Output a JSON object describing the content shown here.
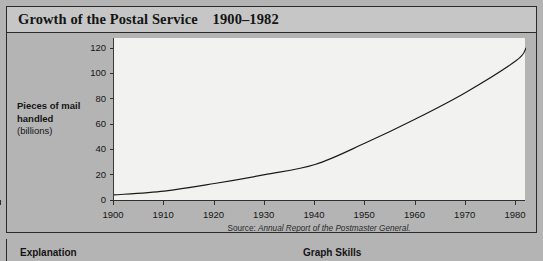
{
  "figure": {
    "title_main": "Growth of the Postal Service",
    "title_range": "1900–1982",
    "title_full": "Growth of the Postal Service    1900–1982",
    "source_label": "Source:",
    "source_title": "Annual Report of the Postmaster General."
  },
  "axis": {
    "y_label_main": "Pieces of mail handled",
    "y_label_line1": "Pieces of mail",
    "y_label_line2": "handled",
    "y_label_units": "(billions)"
  },
  "bottom": {
    "explanation_heading": "Explanation",
    "graph_skills_heading": "Graph Skills"
  },
  "colors": {
    "page_background": "#b4b4b4",
    "title_band": "#c6c6c6",
    "plot_background": "#f2f2f0",
    "frame_border": "#2a2a2a",
    "axis": "#2f2f2f",
    "curve": "#1a1a1a",
    "text": "#141414"
  },
  "chart_data": {
    "type": "line",
    "title": "Growth of the Postal Service    1900–1982",
    "subtitle": "",
    "xlabel": "",
    "ylabel": "Pieces of mail handled (billions)",
    "xlim": [
      1900,
      1982
    ],
    "ylim": [
      0,
      128
    ],
    "grid": false,
    "legend": "none",
    "ytick_labels": [
      "0",
      "20",
      "40",
      "60",
      "80",
      "100",
      "120"
    ],
    "ytick_values": [
      0,
      20,
      40,
      60,
      80,
      100,
      120
    ],
    "xtick_labels": [
      "1900",
      "1910",
      "1920",
      "1930",
      "1940",
      "1950",
      "1960",
      "1970",
      "1980"
    ],
    "xtick_values": [
      1900,
      1910,
      1920,
      1930,
      1940,
      1950,
      1960,
      1970,
      1980
    ],
    "series": [
      {
        "name": "Pieces of mail handled",
        "x": [
          1900,
          1910,
          1920,
          1930,
          1940,
          1950,
          1960,
          1970,
          1980,
          1982
        ],
        "values": [
          4,
          7,
          13,
          20,
          28,
          45,
          64,
          85,
          110,
          120
        ]
      }
    ],
    "annotations": [
      "Source: Annual Report of the Postmaster General."
    ]
  }
}
